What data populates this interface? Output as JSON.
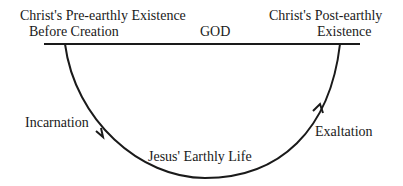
{
  "diagram": {
    "labels": {
      "pre_earthly_line1": "Christ's Pre-earthly Existence",
      "pre_earthly_line2": "Before Creation",
      "god": "GOD",
      "post_earthly_line1": "Christ's Post-earthly",
      "post_earthly_line2": "Existence",
      "incarnation": "Incarnation",
      "earthly_life": "Jesus' Earthly Life",
      "exaltation": "Exaltation"
    },
    "colors": {
      "line": "#1a1a1a",
      "background": "#ffffff"
    }
  }
}
